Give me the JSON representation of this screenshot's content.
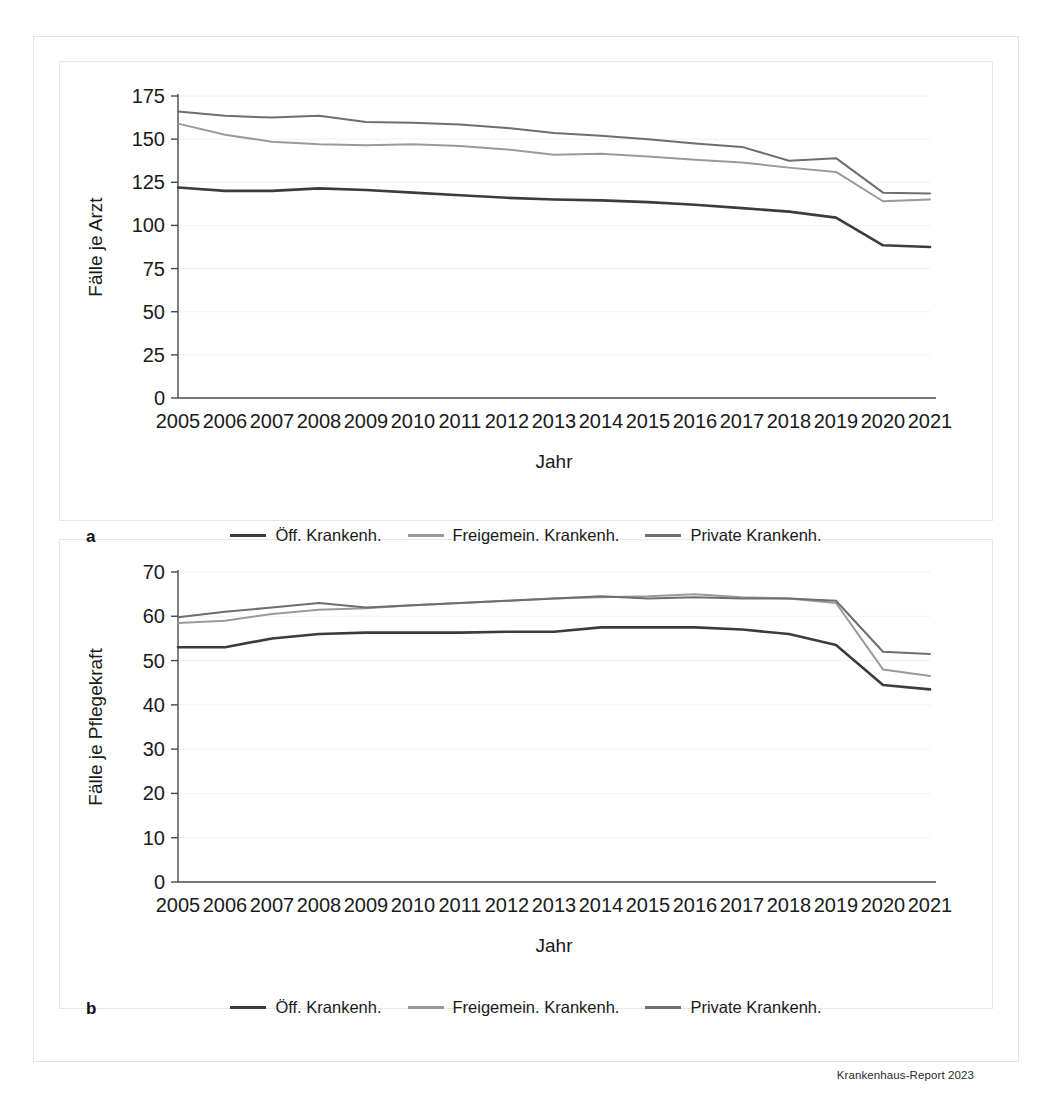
{
  "figure": {
    "source_note": "Krankenhaus-Report 2023",
    "panel_a_letter": "a",
    "panel_b_letter": "b"
  },
  "series_colors": {
    "oeffentlich": "#3c3c3c",
    "freigemeinnuetzig": "#9a9a9a",
    "privat": "#6e6e6e"
  },
  "legend": {
    "items": [
      {
        "label": "Öff. Krankenh.",
        "color": "#3c3c3c"
      },
      {
        "label": "Freigemein. Krankenh.",
        "color": "#9a9a9a"
      },
      {
        "label": "Private Krankenh.",
        "color": "#6e6e6e"
      }
    ]
  },
  "chart_data": [
    {
      "type": "line",
      "panel": "a",
      "title": "",
      "xlabel": "Jahr",
      "ylabel": "Fälle je Arzt",
      "x": [
        2005,
        2006,
        2007,
        2008,
        2009,
        2010,
        2011,
        2012,
        2013,
        2014,
        2015,
        2016,
        2017,
        2018,
        2019,
        2020,
        2021
      ],
      "categories": [
        "2005",
        "2006",
        "2007",
        "2008",
        "2009",
        "2010",
        "2011",
        "2012",
        "2013",
        "2014",
        "2015",
        "2016",
        "2017",
        "2018",
        "2019",
        "2020",
        "2021"
      ],
      "ylim": [
        0,
        175
      ],
      "yticks": [
        0,
        25,
        50,
        75,
        100,
        125,
        150,
        175
      ],
      "grid": true,
      "legend_position": "bottom",
      "series": [
        {
          "name": "Öff. Krankenh.",
          "color": "#3c3c3c",
          "values": [
            122,
            120,
            120,
            121.5,
            120.5,
            119,
            117.5,
            116,
            115,
            114.5,
            113.5,
            112,
            110,
            108,
            104.5,
            88.5,
            87.5
          ]
        },
        {
          "name": "Freigemein. Krankenh.",
          "color": "#9a9a9a",
          "values": [
            159,
            152.5,
            148.5,
            147,
            146.5,
            147,
            146,
            144,
            141,
            141.5,
            140,
            138,
            136.5,
            133.5,
            131,
            114,
            115
          ]
        },
        {
          "name": "Private Krankenh.",
          "color": "#6e6e6e",
          "values": [
            166,
            163.5,
            162.5,
            163.5,
            160,
            159.5,
            158.5,
            156.5,
            153.5,
            152,
            150,
            147.5,
            145.5,
            137.5,
            139,
            119,
            118.5
          ]
        }
      ]
    },
    {
      "type": "line",
      "panel": "b",
      "title": "",
      "xlabel": "Jahr",
      "ylabel": "Fälle je Pflegekraft",
      "x": [
        2005,
        2006,
        2007,
        2008,
        2009,
        2010,
        2011,
        2012,
        2013,
        2014,
        2015,
        2016,
        2017,
        2018,
        2019,
        2020,
        2021
      ],
      "categories": [
        "2005",
        "2006",
        "2007",
        "2008",
        "2009",
        "2010",
        "2011",
        "2012",
        "2013",
        "2014",
        "2015",
        "2016",
        "2017",
        "2018",
        "2019",
        "2020",
        "2021"
      ],
      "ylim": [
        0,
        70
      ],
      "yticks": [
        0,
        10,
        20,
        30,
        40,
        50,
        60,
        70
      ],
      "grid": true,
      "legend_position": "bottom",
      "series": [
        {
          "name": "Öff. Krankenh.",
          "color": "#3c3c3c",
          "values": [
            53,
            53,
            55,
            56,
            56.3,
            56.3,
            56.3,
            56.5,
            56.5,
            57.5,
            57.5,
            57.5,
            57,
            56,
            53.5,
            44.5,
            43.5
          ]
        },
        {
          "name": "Freigemein. Krankenh.",
          "color": "#9a9a9a",
          "values": [
            58.5,
            59,
            60.5,
            61.5,
            61.8,
            62.5,
            63,
            63.5,
            64,
            64.3,
            64.5,
            65,
            64.3,
            64,
            63,
            48,
            46.5
          ]
        },
        {
          "name": "Private Krankenh.",
          "color": "#6e6e6e",
          "values": [
            59.8,
            61,
            62,
            63,
            62,
            62.5,
            63,
            63.5,
            64,
            64.5,
            64,
            64.3,
            64,
            64,
            63.5,
            52,
            51.5
          ]
        }
      ]
    }
  ]
}
